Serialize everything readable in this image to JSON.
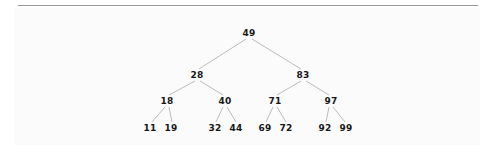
{
  "figure": {
    "kind": "binary-search-tree-diagram",
    "background_color": "#fbfbfb",
    "page_color": "#ffffff",
    "rule_color": "#9a9a9a",
    "edge_color": "#b4b4b4",
    "text_color": "#17171a"
  },
  "chart_data": {
    "type": "diagram",
    "title": "",
    "xlabel": "",
    "ylabel": "",
    "structure": "binary search tree",
    "levels": 4,
    "node_count": 15,
    "root": "49",
    "nodes": [
      {
        "id": "n49",
        "label": "49",
        "level": 0,
        "x": 249,
        "y": 33,
        "parent": null
      },
      {
        "id": "n28",
        "label": "28",
        "level": 1,
        "x": 197,
        "y": 75,
        "parent": "n49"
      },
      {
        "id": "n83",
        "label": "83",
        "level": 1,
        "x": 303,
        "y": 75,
        "parent": "n49"
      },
      {
        "id": "n18",
        "label": "18",
        "level": 2,
        "x": 167,
        "y": 101,
        "parent": "n28"
      },
      {
        "id": "n40",
        "label": "40",
        "level": 2,
        "x": 225,
        "y": 101,
        "parent": "n28"
      },
      {
        "id": "n71",
        "label": "71",
        "level": 2,
        "x": 275,
        "y": 101,
        "parent": "n83"
      },
      {
        "id": "n97",
        "label": "97",
        "level": 2,
        "x": 331,
        "y": 101,
        "parent": "n83"
      },
      {
        "id": "n11",
        "label": "11",
        "level": 3,
        "x": 150,
        "y": 128,
        "parent": "n18"
      },
      {
        "id": "n19",
        "label": "19",
        "level": 3,
        "x": 171,
        "y": 128,
        "parent": "n18"
      },
      {
        "id": "n32",
        "label": "32",
        "level": 3,
        "x": 215,
        "y": 128,
        "parent": "n40"
      },
      {
        "id": "n44",
        "label": "44",
        "level": 3,
        "x": 236,
        "y": 128,
        "parent": "n40"
      },
      {
        "id": "n69",
        "label": "69",
        "level": 3,
        "x": 265,
        "y": 128,
        "parent": "n71"
      },
      {
        "id": "n72",
        "label": "72",
        "level": 3,
        "x": 286,
        "y": 128,
        "parent": "n71"
      },
      {
        "id": "n92",
        "label": "92",
        "level": 3,
        "x": 325,
        "y": 128,
        "parent": "n97"
      },
      {
        "id": "n99",
        "label": "99",
        "level": 3,
        "x": 346,
        "y": 128,
        "parent": "n97"
      }
    ],
    "edges": [
      {
        "from": "n49",
        "to": "n28",
        "x1": 246,
        "y1": 39,
        "x2": 199,
        "y2": 69
      },
      {
        "from": "n49",
        "to": "n83",
        "x1": 252,
        "y1": 39,
        "x2": 301,
        "y2": 69
      },
      {
        "from": "n28",
        "to": "n18",
        "x1": 195,
        "y1": 81,
        "x2": 169,
        "y2": 95
      },
      {
        "from": "n28",
        "to": "n40",
        "x1": 200,
        "y1": 81,
        "x2": 223,
        "y2": 95
      },
      {
        "from": "n83",
        "to": "n71",
        "x1": 301,
        "y1": 81,
        "x2": 277,
        "y2": 95
      },
      {
        "from": "n83",
        "to": "n97",
        "x1": 306,
        "y1": 81,
        "x2": 329,
        "y2": 95
      },
      {
        "from": "n18",
        "to": "n11",
        "x1": 165,
        "y1": 107,
        "x2": 152,
        "y2": 122
      },
      {
        "from": "n18",
        "to": "n19",
        "x1": 169,
        "y1": 107,
        "x2": 172,
        "y2": 122
      },
      {
        "from": "n40",
        "to": "n32",
        "x1": 223,
        "y1": 107,
        "x2": 216,
        "y2": 122
      },
      {
        "from": "n40",
        "to": "n44",
        "x1": 227,
        "y1": 107,
        "x2": 236,
        "y2": 122
      },
      {
        "from": "n71",
        "to": "n69",
        "x1": 273,
        "y1": 107,
        "x2": 266,
        "y2": 122
      },
      {
        "from": "n71",
        "to": "n72",
        "x1": 277,
        "y1": 107,
        "x2": 286,
        "y2": 122
      },
      {
        "from": "n97",
        "to": "n92",
        "x1": 329,
        "y1": 107,
        "x2": 326,
        "y2": 122
      },
      {
        "from": "n97",
        "to": "n99",
        "x1": 333,
        "y1": 107,
        "x2": 345,
        "y2": 122
      }
    ],
    "inorder_values": [
      "11",
      "18",
      "19",
      "28",
      "32",
      "40",
      "44",
      "49",
      "69",
      "71",
      "72",
      "83",
      "92",
      "97",
      "99"
    ]
  }
}
